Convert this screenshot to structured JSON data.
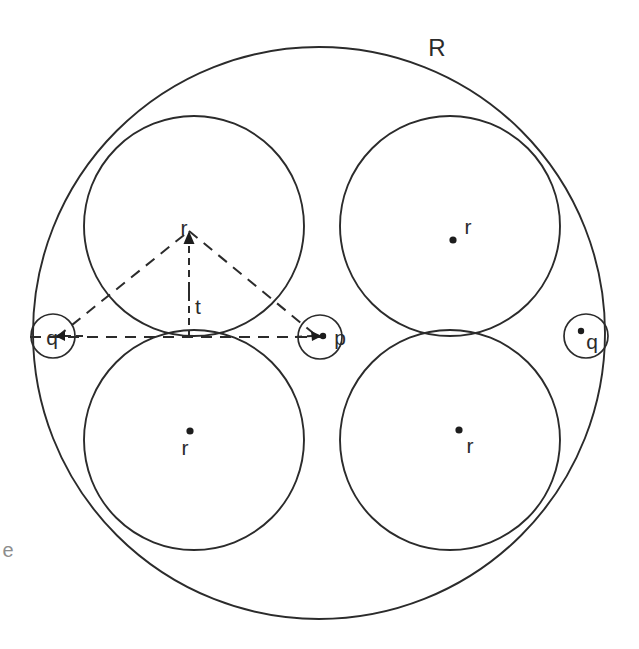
{
  "figure": {
    "background_color": "#ffffff",
    "stroke_color": "#2b2b2b",
    "width": 639,
    "height": 649
  },
  "labels": {
    "outer_radius": "R",
    "circle_r_top_left": "r",
    "circle_r_top_right": "r",
    "circle_r_bottom_left": "r",
    "circle_r_bottom_right": "r",
    "arrow_r": "r",
    "tangent_t": "t",
    "center_p": "p",
    "corner_q_left": "q",
    "corner_q_right": "q",
    "margin_mark": "e"
  },
  "chart_data": {
    "type": "diagram",
    "units": "pixels",
    "outer_circle": {
      "label": "R",
      "cx": 319,
      "cy": 333,
      "r": 286,
      "label_x": 437,
      "label_y": 50
    },
    "large_circles": [
      {
        "label": "r",
        "cx": 194,
        "cy": 226,
        "r": 110,
        "dot_x": 190,
        "dot_y": 0,
        "label_x": 0,
        "label_y": 0,
        "show_dot": false
      },
      {
        "label": "r",
        "cx": 450,
        "cy": 226,
        "r": 110,
        "dot_x": 453,
        "dot_y": 240,
        "label_x": 468,
        "label_y": 228,
        "show_dot": true
      },
      {
        "label": "r",
        "cx": 194,
        "cy": 440,
        "r": 110,
        "dot_x": 190,
        "dot_y": 431,
        "label_x": 185,
        "label_y": 449,
        "show_dot": true
      },
      {
        "label": "r",
        "cx": 450,
        "cy": 440,
        "r": 110,
        "dot_x": 459,
        "dot_y": 430,
        "label_x": 470,
        "label_y": 447,
        "show_dot": true
      }
    ],
    "small_circles": [
      {
        "label": "p",
        "cx": 320,
        "cy": 337,
        "r": 22,
        "label_x": 340,
        "label_y": 339,
        "dot_x": 323,
        "dot_y": 336
      },
      {
        "label": "q",
        "cx": 53,
        "cy": 336,
        "r": 22,
        "label_x": 52,
        "label_y": 339,
        "dot_x": 0,
        "dot_y": 0
      },
      {
        "label": "q",
        "cx": 586,
        "cy": 336,
        "r": 22,
        "label_x": 592,
        "label_y": 343,
        "dot_x": 581,
        "dot_y": 331
      }
    ],
    "dashed_triangle": {
      "apex_x": 189,
      "apex_y": 231,
      "left_x": 57,
      "left_y": 337,
      "right_x": 318,
      "right_y": 337
    },
    "baseline": {
      "x1": 30,
      "y1": 337,
      "x2": 330,
      "y2": 337
    },
    "radius_arrow": {
      "x": 189,
      "y_base": 337,
      "y_tip": 231,
      "label": "r",
      "label_x": 184,
      "label_y": 229
    },
    "tangent_mark": {
      "x": 189,
      "y": 292,
      "label": "t",
      "label_x": 198,
      "label_y": 308
    },
    "margin_mark": {
      "label": "e",
      "x": 4,
      "y": 552
    }
  }
}
